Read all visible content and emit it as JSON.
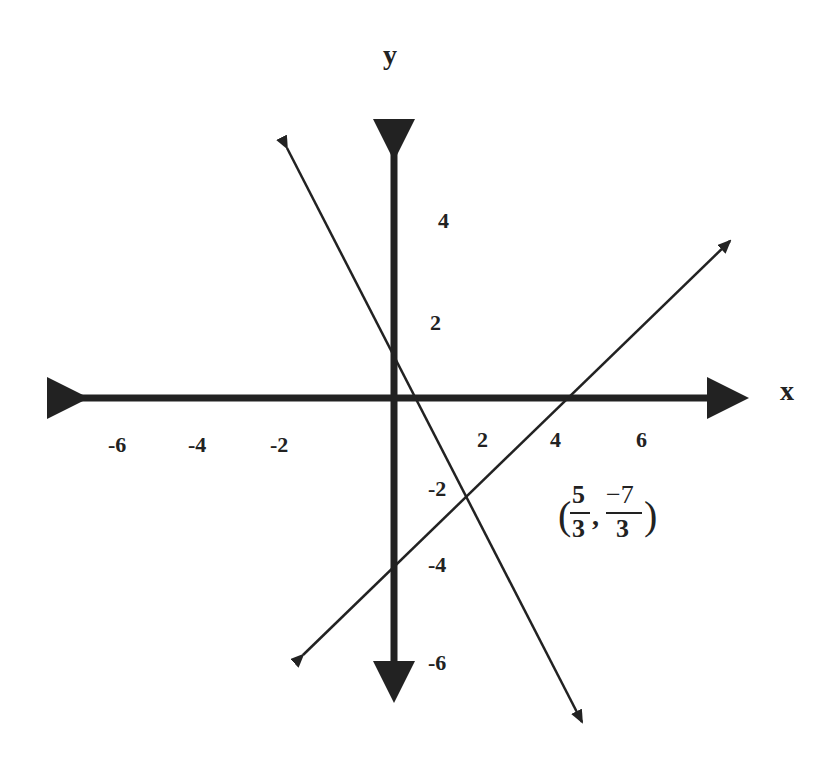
{
  "diagram": {
    "type": "coordinate-plane",
    "title": "",
    "axes": {
      "x_label": "x",
      "y_label": "y",
      "x_ticks": [
        "-6",
        "-4",
        "-2",
        "2",
        "4",
        "6"
      ],
      "y_ticks": [
        "4",
        "2",
        "-2",
        "-4",
        "-6"
      ]
    },
    "lines": [
      {
        "name": "line-decreasing",
        "description": "Steep line with negative slope, y-intercept about 1.5, x-intercept about 0.7"
      },
      {
        "name": "line-increasing",
        "description": "Line with positive slope, y-intercept about -4, x-intercept about 4.2"
      }
    ],
    "intersection": {
      "label_prefix": "(",
      "x_num": "5",
      "x_den": "3",
      "sep": ",",
      "y_num": "−7",
      "y_den": "3",
      "label_suffix": ")"
    },
    "colors": {
      "axis": "#222222",
      "line": "#222222",
      "background": "#ffffff"
    }
  }
}
